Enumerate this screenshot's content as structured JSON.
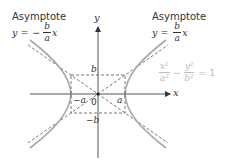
{
  "diagram": {
    "left_asymptote": {
      "label": "Asymptote",
      "eq_lhs": "y =",
      "sign": "−",
      "num": "b",
      "den": "a",
      "var": "x"
    },
    "right_asymptote": {
      "label": "Asymptote",
      "eq_lhs": "y =",
      "num": "b",
      "den": "a",
      "var": "x"
    },
    "hyperbola_equation": {
      "term1_num": "x²",
      "term1_den": "a²",
      "minus": "−",
      "term2_num": "y²",
      "term2_den": "b²",
      "rhs": "= 1"
    },
    "axes": {
      "x_label": "x",
      "y_label": "y",
      "origin_label": "0"
    },
    "points": {
      "b": "b",
      "neg_b": "−b",
      "a": "a",
      "neg_a": "−a"
    },
    "colors": {
      "axis": "#555555",
      "curve": "#a8a8a8",
      "dashed": "#555555",
      "equation_light": "#bdbdbd",
      "text": "#333333"
    }
  }
}
